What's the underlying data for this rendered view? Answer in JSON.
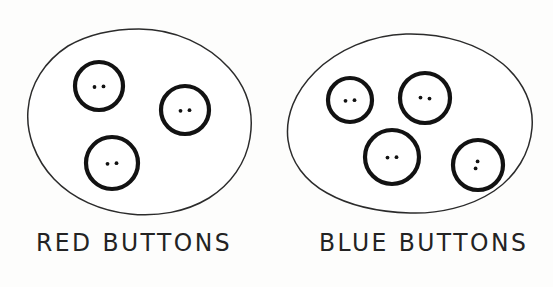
{
  "figure": {
    "kind": "hand-drawn-venn-style-set-diagram",
    "background_color": "#fdfdfc",
    "ink_color": "#232323",
    "button_outline_color": "#121212"
  },
  "groups": [
    {
      "id": "red-buttons",
      "label": "RED BUTTONS",
      "label_position": {
        "x": 36,
        "y": 228
      },
      "button_count": 3,
      "blob": {
        "center": {
          "x": 139,
          "y": 122
        },
        "width": 226,
        "height": 186,
        "left": 26,
        "right": 252,
        "top": 29,
        "bottom": 215
      },
      "buttons": [
        {
          "index": 1,
          "cx": 99,
          "cy": 86,
          "r": 24,
          "holes": 2,
          "hole_layout": "horizontal"
        },
        {
          "index": 2,
          "cx": 185,
          "cy": 110,
          "r": 24,
          "holes": 2,
          "hole_layout": "horizontal"
        },
        {
          "index": 3,
          "cx": 112,
          "cy": 163,
          "r": 26,
          "holes": 2,
          "hole_layout": "horizontal"
        }
      ]
    },
    {
      "id": "blue-buttons",
      "label": "BLUE BUTTONS",
      "label_position": {
        "x": 319,
        "y": 228
      },
      "button_count": 4,
      "blob": {
        "center": {
          "x": 410,
          "y": 124
        },
        "width": 246,
        "height": 180,
        "left": 287,
        "right": 533,
        "top": 34,
        "bottom": 214
      },
      "buttons": [
        {
          "index": 1,
          "cx": 350,
          "cy": 100,
          "r": 22,
          "holes": 2,
          "hole_layout": "horizontal"
        },
        {
          "index": 2,
          "cx": 425,
          "cy": 98,
          "r": 25,
          "holes": 2,
          "hole_layout": "horizontal"
        },
        {
          "index": 3,
          "cx": 392,
          "cy": 157,
          "r": 27,
          "holes": 2,
          "hole_layout": "horizontal"
        },
        {
          "index": 4,
          "cx": 478,
          "cy": 165,
          "r": 25,
          "holes": 2,
          "hole_layout": "vertical-slanted"
        }
      ]
    }
  ],
  "paths": {
    "blob_left": "M 139 29 C 175 29 208 45 229 68 C 248 89 254 114 250 138 C 246 163 231 184 209 198 C 186 212 157 217 130 214 C 101 211 73 199 54 179 C 35 159 26 133 28 110 C 30 84 45 61 68 46 C 89 34 114 29 139 29 Z",
    "blob_right": "M 406 34 C 444 33 479 44 503 64 C 524 82 534 105 532 128 C 530 153 516 176 494 191 C 470 207 438 214 410 213 C 380 212 350 206 327 193 C 305 181 291 162 288 140 C 285 116 295 92 315 72 C 337 50 371 35 406 34 Z"
  }
}
